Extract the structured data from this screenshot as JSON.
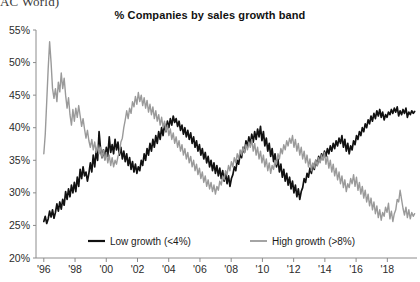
{
  "header": {
    "clipped_source_text": "AC World)"
  },
  "chart_data": {
    "type": "line",
    "title": "% Companies by sales growth band",
    "xlabel": "",
    "ylabel": "",
    "ylim": [
      20,
      55
    ],
    "yticks": [
      20,
      25,
      30,
      35,
      40,
      45,
      50,
      55
    ],
    "ytick_labels": [
      "20%",
      "25%",
      "30%",
      "35%",
      "40%",
      "45%",
      "50%",
      "55%"
    ],
    "xlim": [
      1995.5,
      2019.9
    ],
    "xticks": [
      1996,
      1998,
      2000,
      2002,
      2004,
      2006,
      2008,
      2010,
      2012,
      2014,
      2016,
      2018
    ],
    "xtick_labels": [
      "'96",
      "'98",
      "'00",
      "'02",
      "'04",
      "'06",
      "'08",
      "'10",
      "'12",
      "'14",
      "'16",
      "'18"
    ],
    "grid": false,
    "legend_position": "bottom",
    "colors": {
      "low_growth": "#111111",
      "high_growth": "#9a9a9a",
      "axis": "#8c8c8c"
    },
    "series": [
      {
        "name": "Low growth (<4%)",
        "color": "#111111",
        "values": [
          25.6,
          26.4,
          25.3,
          26.0,
          27.2,
          26.3,
          27.4,
          26.1,
          27.0,
          28.3,
          27.2,
          28.6,
          27.5,
          29.0,
          28.1,
          30.2,
          29.0,
          30.6,
          29.4,
          31.2,
          30.0,
          31.6,
          30.2,
          32.4,
          31.0,
          33.6,
          32.2,
          34.0,
          32.6,
          33.2,
          31.8,
          33.0,
          34.6,
          33.2,
          35.8,
          34.0,
          36.4,
          35.0,
          39.4,
          36.8,
          35.4,
          36.6,
          35.2,
          37.0,
          35.6,
          38.6,
          36.2,
          37.4,
          36.0,
          38.2,
          36.6,
          37.8,
          35.8,
          37.0,
          35.2,
          36.4,
          34.8,
          36.0,
          34.2,
          35.4,
          33.6,
          34.8,
          33.2,
          34.4,
          33.0,
          34.0,
          33.4,
          35.0,
          34.2,
          36.0,
          35.0,
          36.8,
          35.8,
          37.6,
          36.4,
          38.2,
          37.0,
          38.8,
          37.6,
          39.4,
          38.2,
          40.0,
          38.8,
          40.6,
          39.4,
          41.0,
          40.0,
          41.4,
          40.4,
          41.8,
          40.8,
          41.4,
          40.2,
          41.0,
          39.6,
          40.4,
          39.0,
          40.0,
          38.6,
          39.6,
          38.2,
          39.2,
          37.6,
          38.6,
          37.0,
          38.0,
          36.4,
          37.4,
          35.8,
          36.8,
          35.2,
          36.2,
          34.6,
          35.6,
          34.0,
          35.0,
          33.4,
          34.6,
          33.0,
          34.2,
          32.6,
          33.8,
          32.2,
          33.4,
          31.8,
          33.0,
          31.4,
          32.6,
          31.0,
          32.2,
          32.8,
          34.0,
          33.4,
          35.0,
          34.4,
          36.0,
          35.4,
          37.0,
          36.2,
          38.0,
          37.0,
          38.6,
          37.4,
          39.0,
          37.8,
          39.4,
          38.2,
          39.8,
          38.6,
          40.2,
          38.0,
          39.4,
          37.2,
          38.4,
          36.4,
          37.6,
          35.6,
          36.8,
          34.8,
          36.0,
          34.0,
          35.2,
          33.2,
          34.4,
          32.4,
          33.6,
          31.8,
          33.0,
          31.2,
          32.4,
          30.6,
          31.8,
          30.0,
          31.2,
          29.4,
          30.6,
          29.0,
          30.2,
          30.8,
          32.2,
          31.6,
          33.0,
          32.4,
          33.8,
          33.0,
          34.4,
          33.6,
          35.0,
          34.2,
          35.6,
          34.8,
          36.0,
          35.2,
          36.4,
          35.6,
          36.8,
          36.0,
          37.2,
          36.4,
          37.6,
          36.8,
          38.0,
          37.2,
          38.4,
          37.6,
          38.8,
          37.0,
          38.2,
          36.4,
          37.6,
          36.0,
          37.2,
          36.6,
          38.0,
          37.4,
          38.8,
          38.2,
          39.4,
          38.8,
          40.0,
          39.4,
          40.6,
          40.0,
          41.2,
          40.6,
          41.8,
          41.0,
          42.2,
          41.4,
          42.6,
          41.8,
          42.8,
          41.6,
          42.4,
          41.2,
          42.0,
          41.6,
          42.4,
          42.0,
          42.8,
          42.2,
          43.0,
          42.4,
          43.2,
          41.8,
          42.6,
          42.0,
          42.8,
          42.2,
          43.0,
          41.6,
          42.4,
          42.0,
          42.6,
          42.2,
          42.5
        ]
      },
      {
        "name": "High growth (>8%)",
        "color": "#9a9a9a",
        "values": [
          36.0,
          39.0,
          44.0,
          49.0,
          53.2,
          50.0,
          46.0,
          44.5,
          46.0,
          44.0,
          47.0,
          45.5,
          48.4,
          46.0,
          47.6,
          45.0,
          43.0,
          44.6,
          42.0,
          40.4,
          42.8,
          41.0,
          43.0,
          41.6,
          43.4,
          41.8,
          40.2,
          41.4,
          39.8,
          38.4,
          39.6,
          38.0,
          37.0,
          38.2,
          36.6,
          37.8,
          36.2,
          37.4,
          36.0,
          37.0,
          35.4,
          36.6,
          35.0,
          36.2,
          34.6,
          35.8,
          34.2,
          35.4,
          34.0,
          35.0,
          34.4,
          35.6,
          36.2,
          37.8,
          38.4,
          40.0,
          41.2,
          42.6,
          41.4,
          43.0,
          42.2,
          44.0,
          43.2,
          44.8,
          43.6,
          45.4,
          44.0,
          45.0,
          43.4,
          44.6,
          43.0,
          44.2,
          42.4,
          43.6,
          42.0,
          43.2,
          41.4,
          42.6,
          41.0,
          42.0,
          40.4,
          41.6,
          40.0,
          41.0,
          39.4,
          40.4,
          38.8,
          39.8,
          38.2,
          39.2,
          37.6,
          38.6,
          37.0,
          38.0,
          36.4,
          37.4,
          35.8,
          36.8,
          35.2,
          36.2,
          34.6,
          35.6,
          34.0,
          35.0,
          33.4,
          34.4,
          32.8,
          33.8,
          32.2,
          33.2,
          31.6,
          32.6,
          31.0,
          32.0,
          30.6,
          31.6,
          30.2,
          31.2,
          29.8,
          31.0,
          30.4,
          31.8,
          31.2,
          32.6,
          32.0,
          33.4,
          32.8,
          34.2,
          33.4,
          34.8,
          34.0,
          35.4,
          34.6,
          36.0,
          35.2,
          36.6,
          35.8,
          37.0,
          36.2,
          37.4,
          36.6,
          37.8,
          37.0,
          38.2,
          36.4,
          37.6,
          35.8,
          37.0,
          35.2,
          36.4,
          34.6,
          35.8,
          34.0,
          35.2,
          33.4,
          34.6,
          33.0,
          34.2,
          33.6,
          35.0,
          34.4,
          36.0,
          35.2,
          36.8,
          36.0,
          37.4,
          36.6,
          38.0,
          37.2,
          38.4,
          37.6,
          38.8,
          37.0,
          38.2,
          36.4,
          37.6,
          35.8,
          37.0,
          35.2,
          36.4,
          34.6,
          35.8,
          34.0,
          35.2,
          33.4,
          34.6,
          33.8,
          35.0,
          34.2,
          35.4,
          34.6,
          35.8,
          35.0,
          36.2,
          34.4,
          35.6,
          33.8,
          35.0,
          33.2,
          34.4,
          32.6,
          33.8,
          32.0,
          33.2,
          31.4,
          32.6,
          30.8,
          32.0,
          30.2,
          31.4,
          30.8,
          32.2,
          31.4,
          32.8,
          31.0,
          32.4,
          30.4,
          31.6,
          29.8,
          31.0,
          29.2,
          30.4,
          28.6,
          29.8,
          28.0,
          29.2,
          27.4,
          28.6,
          26.8,
          28.0,
          26.2,
          27.4,
          25.8,
          27.0,
          26.4,
          27.8,
          27.0,
          28.4,
          26.0,
          27.2,
          25.6,
          26.8,
          27.4,
          29.0,
          28.6,
          30.4,
          29.0,
          27.6,
          26.6,
          27.8,
          26.2,
          27.4,
          26.0,
          27.0,
          26.4,
          26.8
        ]
      }
    ]
  },
  "legend": {
    "items": [
      {
        "label": "Low growth (<4%)",
        "color": "#111111"
      },
      {
        "label": "High growth (>8%)",
        "color": "#9a9a9a"
      }
    ]
  }
}
